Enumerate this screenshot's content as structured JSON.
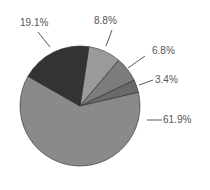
{
  "chart_data": {
    "type": "pie",
    "title": "",
    "start_angle_deg": -81.5,
    "direction": "clockwise",
    "center": [
      80,
      106
    ],
    "radius": 60,
    "slices": [
      {
        "label": "8.8%",
        "value": 8.8,
        "color": "#9a9a9a",
        "label_pos": [
          94,
          24
        ],
        "leader": [
          [
            112,
            30
          ],
          [
            106,
            46
          ]
        ]
      },
      {
        "label": "6.8%",
        "value": 6.8,
        "color": "#7c7c7c",
        "label_pos": [
          152,
          54
        ],
        "leader": [
          [
            145,
            56
          ],
          [
            128,
            68
          ]
        ]
      },
      {
        "label": "3.4%",
        "value": 3.4,
        "color": "#6a6a6a",
        "label_pos": [
          155,
          83
        ],
        "leader": [
          [
            153,
            80
          ],
          [
            139,
            85
          ]
        ]
      },
      {
        "label": "61.9%",
        "value": 61.9,
        "color": "#8a8a8a",
        "label_pos": [
          163,
          123
        ],
        "leader": [
          [
            147,
            120
          ],
          [
            162,
            120
          ]
        ]
      },
      {
        "label": "19.1%",
        "value": 19.1,
        "color": "#333333",
        "label_pos": [
          20,
          26
        ],
        "leader": [
          [
            38,
            32
          ],
          [
            50,
            47
          ]
        ]
      }
    ]
  }
}
